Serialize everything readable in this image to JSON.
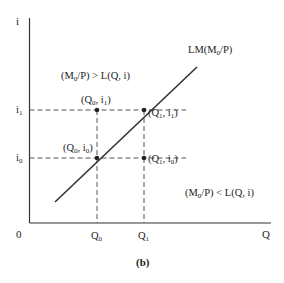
{
  "figure": {
    "caption": "(b)",
    "axes": {
      "y_label": "i",
      "x_label": "Q",
      "origin_label": "0",
      "y_ticks": [
        {
          "base": "i",
          "sub": "1"
        },
        {
          "base": "i",
          "sub": "0"
        }
      ],
      "x_ticks": [
        {
          "base": "Q",
          "sub": "0"
        },
        {
          "base": "Q",
          "sub": "1"
        }
      ]
    },
    "curve": {
      "label_prefix": "LM(M",
      "label_sub": "0",
      "label_suffix": "/P)"
    },
    "points": [
      {
        "name": "Q0-i1",
        "q": "Q",
        "qsub": "0",
        "i": "i",
        "isub": "1"
      },
      {
        "name": "Q1-i1",
        "q": "Q",
        "qsub": "1",
        "i": "i",
        "isub": "1"
      },
      {
        "name": "Q0-i0",
        "q": "Q",
        "qsub": "0",
        "i": "i",
        "isub": "0"
      },
      {
        "name": "Q1-i0",
        "q": "Q",
        "qsub": "1",
        "i": "i",
        "isub": "0"
      }
    ],
    "regions": {
      "excess_supply": {
        "prefix": "(M",
        "sub": "0",
        "suffix": "/P) > L(Q, i)"
      },
      "excess_demand": {
        "prefix": "(M",
        "sub": "0",
        "suffix": "/P) < L(Q, i)"
      }
    },
    "colors": {
      "line": "#333333",
      "dash": "#555555",
      "text": "#222222"
    }
  }
}
